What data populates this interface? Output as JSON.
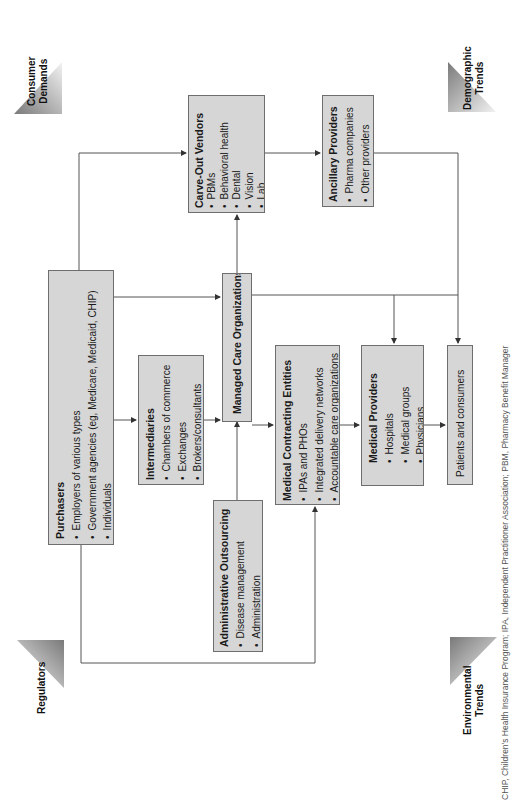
{
  "forces": {
    "consumer_demands": "Consumer\nDemands",
    "demographic_trends": "Demographic\nTrends",
    "regulators": "Regulators",
    "environmental_trends": "Environmental\nTrends"
  },
  "boxes": {
    "purchasers": {
      "title": "Purchasers",
      "items": [
        "Employers of various types",
        "Government agencies (eg, Medicare, Medicaid, CHIP)",
        "Individuals"
      ]
    },
    "intermediaries": {
      "title": "Intermediaries",
      "items": [
        "Chambers of commerce",
        "Exchanges",
        "Brokers/consultants"
      ]
    },
    "managed_care": {
      "title": "Managed Care Organizations"
    },
    "admin_outsourcing": {
      "title": "Administrative Outsourcing",
      "items": [
        "Disease management",
        "Administration"
      ]
    },
    "carve_out": {
      "title": "Carve-Out Vendors",
      "items": [
        "PBMs",
        "Behavioral health",
        "Dental",
        "Vision",
        "Lab"
      ]
    },
    "ancillary": {
      "title": "Ancillary Providers",
      "items": [
        "Pharma companies",
        "Other providers"
      ]
    },
    "medical_contracting": {
      "title": "Medical Contracting Entities",
      "items": [
        "IPAs and PHOs",
        "Integrated delivery networks",
        "Accountable care organizations"
      ]
    },
    "medical_providers": {
      "title": "Medical Providers",
      "items": [
        "Hospitals",
        "Medical groups",
        "Physicians"
      ]
    },
    "patients": {
      "label": "Patients and consumers"
    }
  },
  "caption": "CHIP, Children's Health Insurance Program; IPA, Independent Practitioner Association; PBM, Pharmacy Benefit Manager",
  "colors": {
    "box_fill": "#d6d6d6",
    "box_border": "#6e6e6e",
    "line": "#555555"
  }
}
